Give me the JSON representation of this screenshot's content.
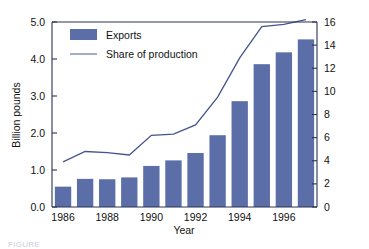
{
  "chart_data": {
    "type": "bar",
    "title": "",
    "xlabel": "Year",
    "ylabel": "Billion pounds",
    "y2label": "",
    "categories": [
      "1986",
      "1987",
      "1988",
      "1989",
      "1990",
      "1991",
      "1992",
      "1993",
      "1994",
      "1995",
      "1996",
      "1997"
    ],
    "x_tick_labels": [
      "1986",
      "1988",
      "1990",
      "1992",
      "1994",
      "1996"
    ],
    "x_tick_categories": [
      "1986",
      "1988",
      "1990",
      "1992",
      "1994",
      "1996"
    ],
    "ylim": [
      0.0,
      5.0
    ],
    "y_ticks": [
      "0.0",
      "1.0",
      "2.0",
      "3.0",
      "4.0",
      "5.0"
    ],
    "y2lim": [
      0,
      16
    ],
    "y2_ticks": [
      "0",
      "2",
      "4",
      "6",
      "8",
      "10",
      "12",
      "14",
      "16"
    ],
    "grid": false,
    "legend_position": "top-left",
    "series": [
      {
        "name": "Exports",
        "kind": "bar",
        "axis": "left",
        "unit": "Billion pounds",
        "values": [
          0.55,
          0.76,
          0.75,
          0.8,
          1.11,
          1.26,
          1.46,
          1.94,
          2.86,
          3.86,
          4.18,
          4.53
        ]
      },
      {
        "name": "Share of production",
        "kind": "line",
        "axis": "right",
        "unit": "percent",
        "values": [
          3.9,
          4.8,
          4.7,
          4.5,
          6.2,
          6.3,
          7.1,
          9.5,
          12.9,
          15.6,
          15.8,
          16.2
        ]
      }
    ]
  },
  "legend": {
    "entries": [
      {
        "label": "Exports",
        "marker": "bar-swatch",
        "color": "#5b6ea8"
      },
      {
        "label": "Share of production",
        "marker": "line",
        "color": "#7b8ab5"
      }
    ]
  },
  "axes": {
    "left_title": "Billion pounds",
    "bottom_title": "Year"
  },
  "colors": {
    "bar": "#5b6ea8",
    "line": "#43558e",
    "axis": "#2b3350",
    "text": "#111111",
    "background": "#ffffff"
  },
  "caption": {
    "text": "FIGURE"
  }
}
